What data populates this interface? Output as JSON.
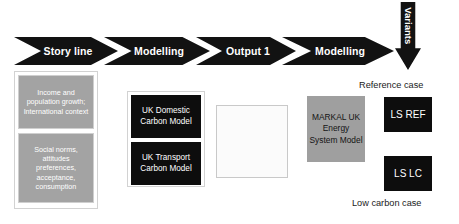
{
  "diagram": {
    "process_flow": {
      "steps": [
        {
          "label": "Story line"
        },
        {
          "label": "Modelling"
        },
        {
          "label": "Output 1"
        },
        {
          "label": "Modelling"
        }
      ],
      "variants_arrow": {
        "label": "Variants",
        "direction": "down"
      }
    },
    "scenario_inputs": {
      "cards": [
        {
          "text": "Income and population growth; International context"
        },
        {
          "text": "Social norms, attitudes preferences, acceptance, consumption"
        }
      ]
    },
    "models": {
      "cards": [
        {
          "text": "UK Domestic Carbon Model"
        },
        {
          "text": "UK Transport Carbon Model"
        }
      ]
    },
    "output_box": {
      "text": ""
    },
    "energy_model": {
      "text": "MARKAL UK Energy System Model"
    },
    "cases": [
      {
        "caption": "Reference case",
        "label": "LS REF"
      },
      {
        "caption": "Low carbon case",
        "label": "LS LC"
      }
    ],
    "colors": {
      "arrow_fill": "#121212",
      "arrow_text": "#ffffff",
      "gray_card": "#a3a3a3",
      "black_card": "#0d0d0d",
      "markal_fill": "#9f9f9f",
      "background": "#ffffff"
    }
  }
}
